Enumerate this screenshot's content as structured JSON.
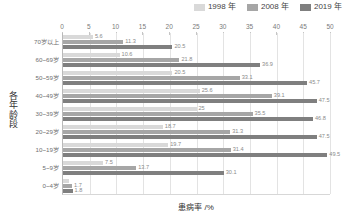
{
  "chart_data": {
    "type": "bar",
    "orientation": "horizontal",
    "title": "",
    "xlabel": "患病率 /%",
    "ylabel": "各年龄段",
    "xlim": [
      0,
      50
    ],
    "xticks": [
      "0",
      "5",
      "10",
      "15",
      "20",
      "25",
      "30",
      "35",
      "40",
      "45",
      "50"
    ],
    "grid": true,
    "legend_position": "top-right",
    "categories": [
      "70岁以上",
      "60~69岁",
      "50~59岁",
      "40~49岁",
      "30~39岁",
      "20~29岁",
      "10~19岁",
      "5~9岁",
      "0~4岁"
    ],
    "series": [
      {
        "name": "1998 年",
        "color": "#d9d9d9",
        "values": [
          5.6,
          10.6,
          20.5,
          25.6,
          25,
          18.7,
          19.7,
          7.5,
          1.1
        ],
        "labels": [
          "5.6",
          "10.6",
          "20.5",
          "25.6",
          "25",
          "18.7",
          "19.7",
          "7.5",
          ""
        ]
      },
      {
        "name": "2008 年",
        "color": "#a6a6a6",
        "values": [
          11.3,
          21.8,
          33.1,
          39.1,
          35.5,
          31.3,
          31.4,
          13.7,
          1.7
        ],
        "labels": [
          "11.3",
          "21.8",
          "33.1",
          "39.1",
          "35.5",
          "31.3",
          "31.4",
          "13.7",
          "1.7"
        ]
      },
      {
        "name": "2019 年",
        "color": "#7f7f7f",
        "values": [
          20.5,
          36.9,
          45.7,
          47.5,
          46.8,
          47.5,
          49.5,
          30.1,
          1.8
        ],
        "labels": [
          "20.5",
          "36.9",
          "45.7",
          "47.5",
          "46.8",
          "47.5",
          "49.5",
          "30.1",
          "1.8"
        ]
      }
    ]
  }
}
